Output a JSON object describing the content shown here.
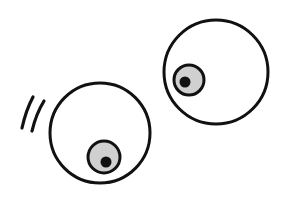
{
  "illustration": {
    "subject": "two cartoon eyeballs",
    "colors": {
      "background": "#ffffff",
      "outline": "#111111",
      "iris": "#d0d0d0",
      "pupil": "#111111"
    },
    "eyes": [
      {
        "name": "left-eye",
        "cx": 100,
        "cy": 133,
        "r": 50,
        "iris": {
          "cx": 104,
          "cy": 157,
          "r": 16
        },
        "pupil": {
          "cx": 106,
          "cy": 162,
          "r": 5
        }
      },
      {
        "name": "right-eye",
        "cx": 216,
        "cy": 72,
        "r": 52,
        "iris": {
          "cx": 189,
          "cy": 80,
          "r": 15
        },
        "pupil": {
          "cx": 185,
          "cy": 82,
          "r": 5
        }
      }
    ],
    "motion_lines": 2
  }
}
